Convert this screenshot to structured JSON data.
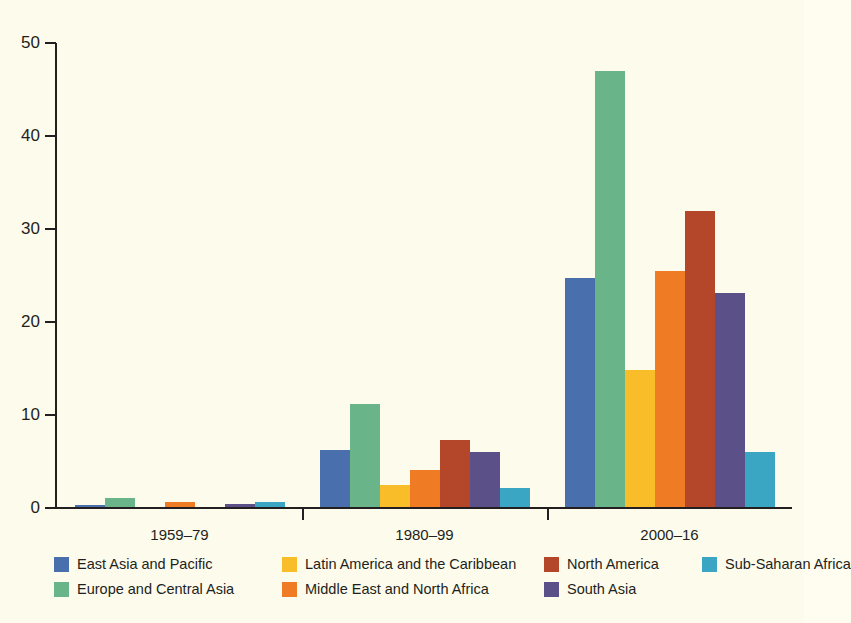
{
  "chart_data": {
    "type": "bar",
    "title": "",
    "subtitle": "",
    "xlabel": "",
    "ylabel": "",
    "categories": [
      "1959–79",
      "1980–99",
      "2000–16"
    ],
    "ylim": [
      0,
      50
    ],
    "yticks": [
      0,
      10,
      20,
      30,
      40,
      50
    ],
    "ytick_labels": [
      "0",
      "10",
      "20",
      "30",
      "40",
      "50"
    ],
    "grid": false,
    "legend_position": "bottom",
    "series": [
      {
        "name": "East Asia and Pacific",
        "color": "#4a6fad",
        "values": [
          0.3,
          6.2,
          24.7
        ]
      },
      {
        "name": "Europe and Central Asia",
        "color": "#6ab48a",
        "values": [
          1.1,
          11.2,
          47.0
        ]
      },
      {
        "name": "Latin America and the Caribbean",
        "color": "#f9bd2a",
        "values": [
          0.0,
          2.5,
          14.8
        ]
      },
      {
        "name": "Middle East and North Africa",
        "color": "#ef7c24",
        "values": [
          0.6,
          4.1,
          25.5
        ]
      },
      {
        "name": "North America",
        "color": "#b4462a",
        "values": [
          0.0,
          7.3,
          31.9
        ]
      },
      {
        "name": "South Asia",
        "color": "#5b5188",
        "values": [
          0.4,
          6.0,
          23.1
        ]
      },
      {
        "name": "Sub-Saharan Africa",
        "color": "#3ba6c4",
        "values": [
          0.7,
          2.1,
          6.0
        ]
      }
    ]
  },
  "legend": {
    "entries": [
      {
        "label": "East Asia and Pacific",
        "color": "#4a6fad"
      },
      {
        "label": "Europe and Central Asia",
        "color": "#6ab48a"
      },
      {
        "label": "Latin America and the Caribbean",
        "color": "#f9bd2a"
      },
      {
        "label": "Middle East and North Africa",
        "color": "#ef7c24"
      },
      {
        "label": "North America",
        "color": "#b4462a"
      },
      {
        "label": "South Asia",
        "color": "#5b5188"
      },
      {
        "label": "Sub-Saharan Africa",
        "color": "#3ba6c4"
      }
    ]
  },
  "colors": {
    "background": "#fdfbec",
    "axis": "#231f20",
    "text": "#231f20"
  }
}
